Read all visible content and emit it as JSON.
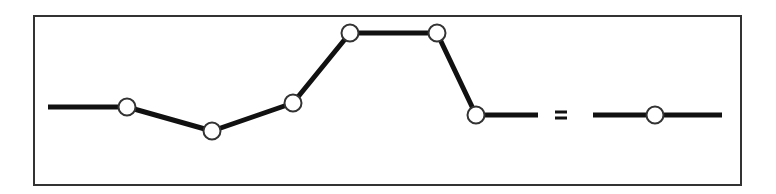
{
  "diagram": {
    "type": "line-profile",
    "frame": {
      "x": 34,
      "y": 16,
      "width": 707,
      "height": 169,
      "stroke": "#333333"
    },
    "line_color": "#111111",
    "node_fill": "#ffffff",
    "node_stroke": "#333333",
    "start_point": {
      "x": 48,
      "y": 107
    },
    "nodes": [
      {
        "x": 127,
        "y": 107
      },
      {
        "x": 212,
        "y": 131
      },
      {
        "x": 293,
        "y": 103
      },
      {
        "x": 350,
        "y": 33
      },
      {
        "x": 437,
        "y": 33
      },
      {
        "x": 476,
        "y": 115
      }
    ],
    "break_segment_end": {
      "x": 538,
      "y": 115
    },
    "break_symbol": {
      "label": "=",
      "x": 561,
      "y": 115
    },
    "resume_segment_start": {
      "x": 593,
      "y": 115
    },
    "final_node": {
      "x": 655,
      "y": 115
    },
    "end_point": {
      "x": 722,
      "y": 115
    }
  }
}
